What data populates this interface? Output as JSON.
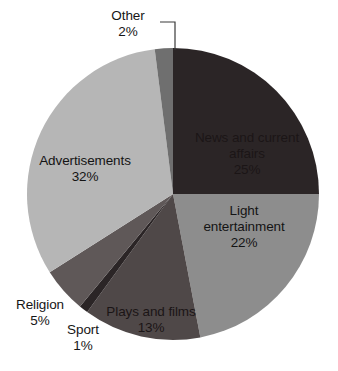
{
  "chart_data": {
    "type": "pie",
    "title": "",
    "subtitle": "",
    "xlabel": "",
    "ylabel": "",
    "legend_position": "none",
    "grid": false,
    "labels_show_percent": true,
    "start_angle_deg": 0,
    "direction": "clockwise",
    "categories": [
      "News and current affairs",
      "Light entertainment",
      "Plays and films",
      "Sport",
      "Religion",
      "Advertisements",
      "Other"
    ],
    "values": [
      25,
      22,
      13,
      1,
      5,
      32,
      2
    ],
    "value_labels": [
      "25%",
      "22%",
      "13%",
      "1%",
      "5%",
      "32%",
      "2%"
    ],
    "colors": [
      "#2b2526",
      "#8d8d8d",
      "#4f4848",
      "#2b2526",
      "#5f5858",
      "#b6b6b6",
      "#6f6f6f"
    ],
    "slices": [
      {
        "name": "News and current affairs",
        "value": 25,
        "value_label": "25%",
        "color": "#2b2526",
        "label_placement": "inside"
      },
      {
        "name": "Light entertainment",
        "value": 22,
        "value_label": "22%",
        "color": "#8d8d8d",
        "label_placement": "inside"
      },
      {
        "name": "Plays and films",
        "value": 13,
        "value_label": "13%",
        "color": "#4f4848",
        "label_placement": "inside"
      },
      {
        "name": "Sport",
        "value": 1,
        "value_label": "1%",
        "color": "#2b2526",
        "label_placement": "outside"
      },
      {
        "name": "Religion",
        "value": 5,
        "value_label": "5%",
        "color": "#5f5858",
        "label_placement": "outside"
      },
      {
        "name": "Advertisements",
        "value": 32,
        "value_label": "32%",
        "color": "#b6b6b6",
        "label_placement": "inside"
      },
      {
        "name": "Other",
        "value": 2,
        "value_label": "2%",
        "color": "#6f6f6f",
        "label_placement": "outside-leader"
      }
    ],
    "geometry": {
      "center_x": 173,
      "center_y": 194,
      "radius": 146
    }
  },
  "labels": {
    "news_name": "News and current",
    "news_name2": "affairs",
    "news_value": "25%",
    "light_name": "Light",
    "light_name2": "entertainment",
    "light_value": "22%",
    "plays_name": "Plays and films",
    "plays_value": "13%",
    "sport_name": "Sport",
    "sport_value": "1%",
    "religion_name": "Religion",
    "religion_value": "5%",
    "ads_name": "Advertisements",
    "ads_value": "32%",
    "other_name": "Other",
    "other_value": "2%"
  }
}
